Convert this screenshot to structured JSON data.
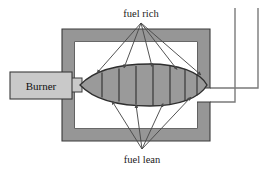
{
  "figure": {
    "type": "schematic-diagram",
    "width": 277,
    "height": 171,
    "background_color": "#ffffff"
  },
  "labels": {
    "top": "fuel rich",
    "bottom": "fuel lean",
    "burner": "Burner"
  },
  "colors": {
    "wall_fill": "#969696",
    "flame_fill": "#9a9a9a",
    "burner_fill": "#c9c9c9",
    "chamber_interior": "#ffffff",
    "outline": "#3a3a3a",
    "arrow": "#4a4a4a",
    "text": "#1a1a1a"
  },
  "chamber": {
    "outer": {
      "x": 62,
      "y": 29,
      "width": 148,
      "height": 112
    },
    "wall_thickness": 13,
    "interior": {
      "x": 75,
      "y": 42,
      "width": 122,
      "height": 86
    }
  },
  "burner": {
    "box": {
      "x": 10,
      "y": 72,
      "width": 62,
      "height": 27
    },
    "nozzle": {
      "x": 72,
      "y": 78,
      "width": 8,
      "height": 15
    }
  },
  "flame": {
    "shape": "ellipse-pointed-left",
    "center_x": 145,
    "center_y": 85,
    "radius_x": 62,
    "radius_y": 20,
    "segment_count": 8,
    "divider_count": 7,
    "tip_x": 80
  },
  "exhaust": {
    "description": "duct exits right wall then turns upward off top edge",
    "outlet_y": 95,
    "duct_inner_x": 235,
    "duct_outer_x": 258,
    "duct_top_y": 8
  },
  "arrows": {
    "fuel_rich": {
      "origin": {
        "x": 141,
        "y": 22
      },
      "count": 5,
      "targets": [
        {
          "x": 97,
          "y": 73
        },
        {
          "x": 124,
          "y": 68
        },
        {
          "x": 152,
          "y": 67
        },
        {
          "x": 177,
          "y": 70
        },
        {
          "x": 200,
          "y": 74
        }
      ]
    },
    "fuel_lean": {
      "origin": {
        "x": 142,
        "y": 150
      },
      "count": 4,
      "targets": [
        {
          "x": 112,
          "y": 101
        },
        {
          "x": 136,
          "y": 104
        },
        {
          "x": 163,
          "y": 103
        },
        {
          "x": 190,
          "y": 97
        }
      ]
    }
  }
}
